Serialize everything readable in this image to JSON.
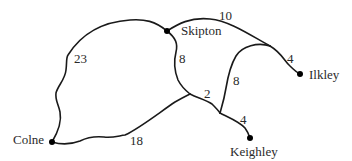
{
  "diagram": {
    "type": "weighted-network",
    "towns": [
      {
        "id": "skipton",
        "label": "Skipton"
      },
      {
        "id": "ilkley",
        "label": "Ilkley"
      },
      {
        "id": "colne",
        "label": "Colne"
      },
      {
        "id": "keighley",
        "label": "Keighley"
      }
    ],
    "edges": [
      {
        "id": "colne-skipton",
        "from": "Colne",
        "to": "Skipton",
        "weight": "23"
      },
      {
        "id": "skipton-junction-east",
        "from": "Skipton",
        "to": "East junction",
        "weight": "10"
      },
      {
        "id": "junction-east-ilkley",
        "from": "East junction",
        "to": "Ilkley",
        "weight": "4"
      },
      {
        "id": "skipton-junction-a",
        "from": "Skipton",
        "to": "Junction A",
        "weight": "8"
      },
      {
        "id": "junction-east-junction-b",
        "from": "East junction",
        "to": "Junction B",
        "weight": "8"
      },
      {
        "id": "junction-a-junction-b",
        "from": "Junction A",
        "to": "Junction B",
        "weight": "2"
      },
      {
        "id": "junction-b-keighley",
        "from": "Junction B",
        "to": "Keighley",
        "weight": "4"
      },
      {
        "id": "colne-junction-a",
        "from": "Colne",
        "to": "Junction A",
        "weight": "18"
      }
    ]
  }
}
